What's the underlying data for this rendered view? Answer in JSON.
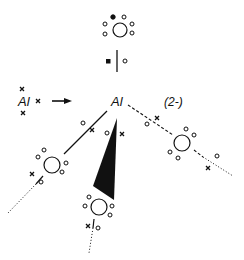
{
  "diagram": {
    "reactant_label": "Al",
    "product_center_label": "Al",
    "charge_label": "(2-)",
    "arrow": "reaction-arrow",
    "legend_symbols": {
      "cross": "electron from Al",
      "open_circle": "electron from ligand",
      "filled_circle": "extra electron (charge)",
      "filled_square": "extra electron (charge)"
    },
    "ligands": [
      {
        "position": "top",
        "bond": "solid-vertical"
      },
      {
        "position": "left",
        "bond": "solid"
      },
      {
        "position": "front",
        "bond": "wedge"
      },
      {
        "position": "right",
        "bond": "dashed"
      }
    ],
    "colors": {
      "ink": "#111111",
      "background": "#ffffff"
    }
  }
}
